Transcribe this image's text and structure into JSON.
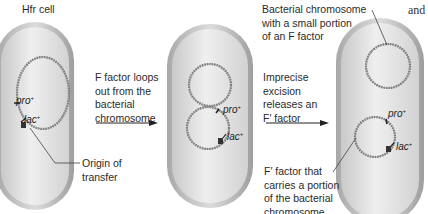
{
  "figure": {
    "title_label": "Hfr cell",
    "step1_caption": "F factor loops\nout from the\nbacterial\nchromosome",
    "step2_caption": "Imprecise\nexcision\nreleases an\nF′ factor",
    "origin_label": "Origin of\ntransfer",
    "bact_chrom_label": "Bacterial chromosome\nwith a small portion\nof an F factor",
    "f_prime_label": "F′ factor that\ncarries a portion\nof the bacterial\nchromosome",
    "cut_text": "and"
  },
  "genes": {
    "pro": "pro",
    "lac": "lac",
    "sup": "+"
  },
  "cells": [
    {
      "name": "hfr-cell",
      "stage": 1
    },
    {
      "name": "looping-cell",
      "stage": 2
    },
    {
      "name": "f-prime-cell",
      "stage": 3
    }
  ],
  "colors": {
    "cell_outer": "#9a9a9a",
    "cell_rim": "#d6d6d6",
    "cell_inner": "#e6e6e6",
    "dna": "#555555",
    "text": "#2b2b2b"
  }
}
